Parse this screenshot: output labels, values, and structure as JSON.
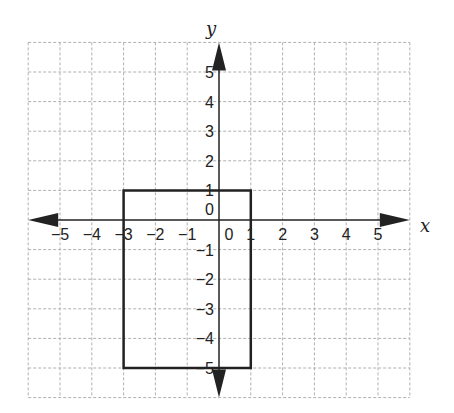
{
  "chart_data": {
    "type": "coordinate-plane",
    "xlabel": "x",
    "ylabel": "y",
    "xlim": [
      -6,
      6
    ],
    "ylim": [
      -6,
      6
    ],
    "grid": true,
    "grid_style": "dashed",
    "x_tick_labels": [
      "−5",
      "−4",
      "−3",
      "−2",
      "−1",
      "0",
      "1",
      "2",
      "3",
      "4",
      "5"
    ],
    "y_tick_labels": [
      "5",
      "4",
      "3",
      "2",
      "1",
      "0",
      "−1",
      "−2",
      "−3",
      "−4",
      "−5"
    ],
    "shapes": [
      {
        "type": "rectangle",
        "vertices": [
          [
            -3,
            1
          ],
          [
            1,
            1
          ],
          [
            1,
            -5
          ],
          [
            -3,
            -5
          ]
        ],
        "stroke": "#222222"
      }
    ]
  },
  "axes": {
    "x_label": "x",
    "y_label": "y",
    "x_ticks": [
      {
        "value": -5,
        "label": "−5"
      },
      {
        "value": -4,
        "label": "−4"
      },
      {
        "value": -3,
        "label": "−3"
      },
      {
        "value": -2,
        "label": "−2"
      },
      {
        "value": -1,
        "label": "−1"
      },
      {
        "value": 0,
        "label": "0"
      },
      {
        "value": 1,
        "label": "1"
      },
      {
        "value": 2,
        "label": "2"
      },
      {
        "value": 3,
        "label": "3"
      },
      {
        "value": 4,
        "label": "4"
      },
      {
        "value": 5,
        "label": "5"
      }
    ],
    "y_ticks": [
      {
        "value": 5,
        "label": "5"
      },
      {
        "value": 4,
        "label": "4"
      },
      {
        "value": 3,
        "label": "3"
      },
      {
        "value": 2,
        "label": "2"
      },
      {
        "value": 1,
        "label": "1"
      },
      {
        "value": 0,
        "label": "0"
      },
      {
        "value": -1,
        "label": "−1"
      },
      {
        "value": -2,
        "label": "−2"
      },
      {
        "value": -3,
        "label": "−3"
      },
      {
        "value": -4,
        "label": "−4"
      },
      {
        "value": -5,
        "label": "−5"
      }
    ]
  },
  "colors": {
    "grid": "#b0b0b0",
    "axis": "#222222",
    "shape": "#222222"
  }
}
